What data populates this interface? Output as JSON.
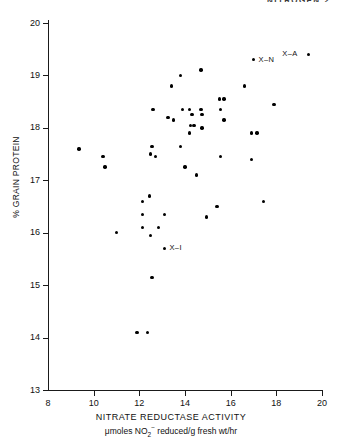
{
  "figure": {
    "running_head": "NITROGEN 2"
  },
  "chart_data": {
    "type": "scatter",
    "title": "",
    "xlabel": "NITRATE REDUCTASE ACTIVITY",
    "xsublabel_parts": {
      "pre": "μmoles NO",
      "sub": "2",
      "sup": "−",
      "post": " reduced/g fresh wt/hr"
    },
    "xsublabel": "μmoles NO2- reduced/g fresh wt/hr",
    "ylabel": "% GRAIN PROTEIN",
    "xlim": [
      8,
      20
    ],
    "ylim": [
      13,
      20
    ],
    "xticks": [
      8,
      10,
      12,
      14,
      16,
      18,
      20
    ],
    "yticks": [
      13,
      14,
      15,
      16,
      17,
      18,
      19,
      20
    ],
    "grid": false,
    "legend": "none",
    "marker": "filled-circle",
    "marker_color": "#000000",
    "points": [
      {
        "x": 19.4,
        "y": 19.4
      },
      {
        "x": 17.0,
        "y": 19.3
      },
      {
        "x": 14.7,
        "y": 19.1
      },
      {
        "x": 13.8,
        "y": 19.0
      },
      {
        "x": 16.6,
        "y": 18.8
      },
      {
        "x": 13.4,
        "y": 18.8
      },
      {
        "x": 15.5,
        "y": 18.55
      },
      {
        "x": 15.7,
        "y": 18.55
      },
      {
        "x": 17.9,
        "y": 18.45
      },
      {
        "x": 12.6,
        "y": 18.35
      },
      {
        "x": 14.2,
        "y": 18.35
      },
      {
        "x": 14.7,
        "y": 18.35
      },
      {
        "x": 15.55,
        "y": 18.35
      },
      {
        "x": 13.9,
        "y": 18.35
      },
      {
        "x": 14.75,
        "y": 18.25
      },
      {
        "x": 14.3,
        "y": 18.25
      },
      {
        "x": 13.25,
        "y": 18.2
      },
      {
        "x": 13.5,
        "y": 18.15
      },
      {
        "x": 15.7,
        "y": 18.15
      },
      {
        "x": 14.25,
        "y": 18.05
      },
      {
        "x": 14.4,
        "y": 18.05
      },
      {
        "x": 14.75,
        "y": 18.0
      },
      {
        "x": 14.2,
        "y": 17.9
      },
      {
        "x": 16.9,
        "y": 17.9
      },
      {
        "x": 17.15,
        "y": 17.9
      },
      {
        "x": 12.55,
        "y": 17.65
      },
      {
        "x": 13.8,
        "y": 17.65
      },
      {
        "x": 9.35,
        "y": 17.6
      },
      {
        "x": 12.5,
        "y": 17.5
      },
      {
        "x": 10.4,
        "y": 17.45
      },
      {
        "x": 12.7,
        "y": 17.45
      },
      {
        "x": 15.55,
        "y": 17.45
      },
      {
        "x": 16.9,
        "y": 17.4
      },
      {
        "x": 10.5,
        "y": 17.25
      },
      {
        "x": 14.0,
        "y": 17.25
      },
      {
        "x": 14.5,
        "y": 17.1
      },
      {
        "x": 12.45,
        "y": 16.7
      },
      {
        "x": 12.15,
        "y": 16.6
      },
      {
        "x": 17.45,
        "y": 16.6
      },
      {
        "x": 15.4,
        "y": 16.5
      },
      {
        "x": 12.15,
        "y": 16.35
      },
      {
        "x": 13.1,
        "y": 16.35
      },
      {
        "x": 14.95,
        "y": 16.3
      },
      {
        "x": 12.15,
        "y": 16.1
      },
      {
        "x": 12.85,
        "y": 16.1
      },
      {
        "x": 11.0,
        "y": 16.0
      },
      {
        "x": 12.5,
        "y": 15.95
      },
      {
        "x": 13.1,
        "y": 15.7
      },
      {
        "x": 12.55,
        "y": 15.15
      },
      {
        "x": 11.9,
        "y": 14.1
      },
      {
        "x": 12.35,
        "y": 14.1
      }
    ],
    "annotations": [
      {
        "label": "X–A",
        "x": 19.4,
        "y": 19.4,
        "side": "left"
      },
      {
        "label": "X–N",
        "x": 17.0,
        "y": 19.3,
        "side": "right"
      },
      {
        "label": "X–I",
        "x": 13.1,
        "y": 15.7,
        "side": "right"
      }
    ]
  }
}
